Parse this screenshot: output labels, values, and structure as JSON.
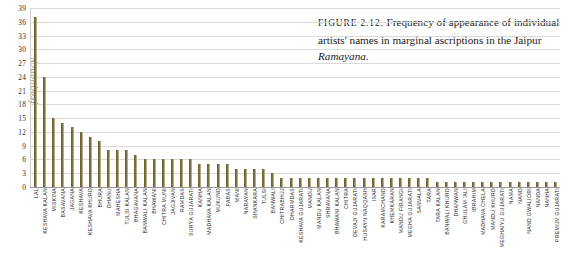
{
  "caption": {
    "prefix": "FIGURE 2.12.",
    "line1": " Frequency of appearance of",
    "line2": "individual artists' names in marginal ascriptions",
    "line3_pre": "in the Jaipur ",
    "line3_italic": "Ramayana",
    "line3_post": "."
  },
  "colors": {
    "bar": "#7d7140",
    "gridline": "#d9d9d9",
    "axis": "#9a9a9a",
    "ylabel": "#9a9580",
    "text": "#1c1c1c"
  },
  "chart_data": {
    "type": "bar",
    "title": "",
    "xlabel": "",
    "ylabel": "frequency",
    "ylim": [
      0,
      39
    ],
    "ytick_step": 3,
    "yticks": [
      0,
      3,
      6,
      9,
      12,
      15,
      18,
      21,
      24,
      27,
      30,
      33,
      36,
      39
    ],
    "grid": true,
    "legend": "none",
    "categories": [
      "LAL",
      "KESHAVA KALAN",
      "MISKINA",
      "BASAVANA",
      "JAGANA",
      "KESHAVA",
      "KESHAVA KHURD",
      "BHURA",
      "DHANU",
      "MAHESHA",
      "TULSI KALAN",
      "BHAGAVANA",
      "BANWALI KALAN",
      "BHAWANI",
      "CHITRA MUNI",
      "JAGJIVAN",
      "RAMDAS",
      "SURYA GUJARATI",
      "KANHA",
      "MADHAVA KALAN",
      "MUKUND",
      "PABAS",
      "MANI",
      "NARAYAN",
      "SHANKARA",
      "TULSI",
      "BANWALI",
      "CHITRABHUJ",
      "DHARMDAS",
      "KESHAVA GUJARATI",
      "MANDU",
      "MANDU KALAN",
      "SHRAVANA",
      "BHAWANI KALAN",
      "CHITRA",
      "DEVAJI GUJARATI",
      "HUSAYN NAQQASH",
      "ISAR",
      "KARAMCHAND",
      "KHEMKARAN",
      "MANDU FIRANGI",
      "MEGHA GUJARATI",
      "SANVALA",
      "TARA",
      "TARA KALAN",
      "BANWALI KHURD",
      "DHANWAN",
      "GHULAM 'ALI",
      "IBRAHIM",
      "MADHAVA CHELA",
      "MANDU KHURD",
      "MEGHAIYU GUJARATI",
      "NAMA",
      "NAND",
      "NAND GWALIORI",
      "NANDA",
      "NANHA",
      "PREMIJV GUJARATI"
    ],
    "values": [
      37,
      24,
      15,
      14,
      13,
      12,
      11,
      10,
      8,
      8,
      8,
      7,
      6,
      6,
      6,
      6,
      6,
      6,
      5,
      5,
      5,
      5,
      4,
      4,
      4,
      4,
      3,
      2,
      2,
      2,
      2,
      2,
      2,
      2,
      2,
      2,
      2,
      2,
      2,
      2,
      2,
      2,
      2,
      2,
      1,
      1,
      1,
      1,
      1,
      1,
      1,
      1,
      1,
      1,
      1,
      1,
      1,
      1
    ]
  }
}
